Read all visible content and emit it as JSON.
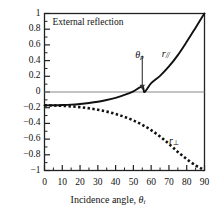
{
  "chart_data": {
    "type": "line",
    "title": "External reflection",
    "xlabel": "Incidence angle, θi",
    "ylabel": "",
    "xlim": [
      0,
      90
    ],
    "ylim": [
      -1,
      1
    ],
    "xticks": [
      "0",
      "10",
      "20",
      "30",
      "40",
      "50",
      "60",
      "70",
      "80",
      "90"
    ],
    "xtick_values": [
      0,
      10,
      20,
      30,
      40,
      50,
      60,
      70,
      80,
      90
    ],
    "xminor_step": 5,
    "yticks": [
      "1",
      "0.8",
      "0.6",
      "0.4",
      "0.2",
      "0",
      "−0.2",
      "−0.4",
      "−0.6",
      "−0.8",
      "−1"
    ],
    "ytick_values": [
      1,
      0.8,
      0.6,
      0.4,
      0.2,
      0,
      -0.2,
      -0.4,
      -0.6,
      -0.8,
      -1
    ],
    "yminor_step": 0.1,
    "grid": false,
    "zero_line": true,
    "legend": "inline-labels",
    "annotations": [
      {
        "name": "brewster-angle",
        "text": "θp",
        "x": 55,
        "y": 0.45,
        "arrow_to_y": 0.02
      }
    ],
    "series": [
      {
        "name": "r_parallel",
        "label": "r//",
        "style": "solid",
        "x": [
          0,
          5,
          10,
          15,
          20,
          25,
          30,
          35,
          40,
          45,
          50,
          55,
          56.3,
          60,
          65,
          70,
          75,
          80,
          85,
          88,
          90
        ],
        "values": [
          -0.17,
          -0.169,
          -0.166,
          -0.161,
          -0.152,
          -0.14,
          -0.124,
          -0.102,
          -0.074,
          -0.038,
          0.008,
          0.07,
          0.0,
          0.112,
          0.206,
          0.325,
          0.47,
          0.64,
          0.82,
          0.93,
          1.0
        ]
      },
      {
        "name": "r_perpendicular",
        "label": "r⊥",
        "style": "dotted",
        "x": [
          0,
          5,
          10,
          15,
          20,
          25,
          30,
          35,
          40,
          45,
          50,
          55,
          60,
          65,
          70,
          75,
          80,
          85,
          88,
          90
        ],
        "values": [
          -0.17,
          -0.172,
          -0.176,
          -0.183,
          -0.193,
          -0.208,
          -0.226,
          -0.25,
          -0.28,
          -0.316,
          -0.362,
          -0.418,
          -0.486,
          -0.567,
          -0.661,
          -0.763,
          -0.855,
          -0.935,
          -0.972,
          -1.0
        ]
      }
    ]
  },
  "labels": {
    "title": "External reflection",
    "xtitle_main": "Incidence angle, ",
    "xtitle_sym": "θ",
    "xtitle_sub": "i",
    "r_par_sym": "r",
    "r_par_sub": "//",
    "r_perp_sym": "r",
    "r_perp_sub": "⊥",
    "theta_p_sym": "θ",
    "theta_p_sub": "p"
  },
  "colors": {
    "frame": "#222222",
    "curve": "#111111",
    "zero_line": "#888888",
    "text": "#111111",
    "background": "#ffffff"
  }
}
